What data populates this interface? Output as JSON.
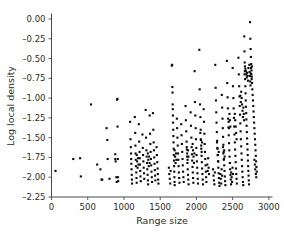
{
  "figure": {
    "background_color": "#ffffff",
    "marker_color": "#0a0a0a",
    "axis_color": "#4a4a4a"
  },
  "chart_data": {
    "type": "scatter",
    "title": "",
    "xlabel": "Range size",
    "ylabel": "Log local density",
    "xlim": [
      0,
      3050
    ],
    "ylim": [
      -2.25,
      0.05
    ],
    "xticks": [
      0,
      500,
      1000,
      1500,
      2000,
      2500,
      3000
    ],
    "xticklabels": [
      "0",
      "500",
      "1000",
      "1500",
      "2000",
      "2500",
      "3000"
    ],
    "yticks": [
      0.0,
      -0.25,
      -0.5,
      -0.75,
      -1.0,
      -1.25,
      -1.5,
      -1.75,
      -2.0,
      -2.25
    ],
    "yticklabels": [
      "0.00",
      "–0.25",
      "–0.50",
      "–0.75",
      "–1.00",
      "–1.25",
      "–1.50",
      "–1.75",
      "–2.00",
      "–2.25"
    ],
    "grid": false,
    "legend": null,
    "marker": "square",
    "marker_size": 2.1,
    "points": [
      [
        55,
        -1.92
      ],
      [
        300,
        -1.77
      ],
      [
        395,
        -1.76
      ],
      [
        405,
        -1.99
      ],
      [
        545,
        -1.08
      ],
      [
        630,
        -1.84
      ],
      [
        675,
        -1.9
      ],
      [
        690,
        -2.03
      ],
      [
        700,
        -2.03
      ],
      [
        760,
        -1.38
      ],
      [
        770,
        -1.53
      ],
      [
        775,
        -1.77
      ],
      [
        800,
        -2.02
      ],
      [
        880,
        -1.77
      ],
      [
        880,
        -1.71
      ],
      [
        885,
        -1.8
      ],
      [
        895,
        -2.0
      ],
      [
        900,
        -2.06
      ],
      [
        905,
        -1.02
      ],
      [
        910,
        -1.01
      ],
      [
        912,
        -1.36
      ],
      [
        915,
        -1.77
      ],
      [
        918,
        -2.0
      ],
      [
        920,
        -2.05
      ],
      [
        1085,
        -1.3
      ],
      [
        1090,
        -1.52
      ],
      [
        1095,
        -1.62
      ],
      [
        1098,
        -1.7
      ],
      [
        1100,
        -1.77
      ],
      [
        1102,
        -1.83
      ],
      [
        1105,
        -1.9
      ],
      [
        1108,
        -1.97
      ],
      [
        1110,
        -2.03
      ],
      [
        1112,
        -2.08
      ],
      [
        1150,
        -1.24
      ],
      [
        1155,
        -1.44
      ],
      [
        1158,
        -1.6
      ],
      [
        1160,
        -1.7
      ],
      [
        1163,
        -1.78
      ],
      [
        1166,
        -1.86
      ],
      [
        1170,
        -1.94
      ],
      [
        1173,
        -2.01
      ],
      [
        1176,
        -2.07
      ],
      [
        1205,
        -1.33
      ],
      [
        1210,
        -1.55
      ],
      [
        1215,
        -1.68
      ],
      [
        1218,
        -1.76
      ],
      [
        1222,
        -1.84
      ],
      [
        1225,
        -1.92
      ],
      [
        1228,
        -1.99
      ],
      [
        1232,
        -2.05
      ],
      [
        1255,
        -1.46
      ],
      [
        1260,
        -1.63
      ],
      [
        1264,
        -1.72
      ],
      [
        1268,
        -1.8
      ],
      [
        1272,
        -1.88
      ],
      [
        1276,
        -1.95
      ],
      [
        1280,
        -2.02
      ],
      [
        1300,
        -1.15
      ],
      [
        1305,
        -1.5
      ],
      [
        1310,
        -1.66
      ],
      [
        1314,
        -1.74
      ],
      [
        1318,
        -1.82
      ],
      [
        1322,
        -1.9
      ],
      [
        1326,
        -1.97
      ],
      [
        1330,
        -2.04
      ],
      [
        1334,
        -2.09
      ],
      [
        1355,
        -1.22
      ],
      [
        1360,
        -1.45
      ],
      [
        1364,
        -1.58
      ],
      [
        1368,
        -1.68
      ],
      [
        1372,
        -1.77
      ],
      [
        1376,
        -1.85
      ],
      [
        1380,
        -1.93
      ],
      [
        1384,
        -2.0
      ],
      [
        1388,
        -2.06
      ],
      [
        1400,
        -1.19
      ],
      [
        1405,
        -1.4
      ],
      [
        1410,
        -1.56
      ],
      [
        1414,
        -1.66
      ],
      [
        1418,
        -1.75
      ],
      [
        1422,
        -1.83
      ],
      [
        1426,
        -1.91
      ],
      [
        1430,
        -1.98
      ],
      [
        1434,
        -2.04
      ],
      [
        1450,
        -1.62
      ],
      [
        1455,
        -1.72
      ],
      [
        1460,
        -1.81
      ],
      [
        1464,
        -1.89
      ],
      [
        1468,
        -1.96
      ],
      [
        1472,
        -2.03
      ],
      [
        1476,
        -2.08
      ],
      [
        1660,
        -0.59
      ],
      [
        1665,
        -0.58
      ],
      [
        1668,
        -0.86
      ],
      [
        1670,
        -0.93
      ],
      [
        1672,
        -1.08
      ],
      [
        1674,
        -1.14
      ],
      [
        1676,
        -1.22
      ],
      [
        1678,
        -1.31
      ],
      [
        1680,
        -1.4
      ],
      [
        1682,
        -1.48
      ],
      [
        1684,
        -1.56
      ],
      [
        1686,
        -1.64
      ],
      [
        1688,
        -1.72
      ],
      [
        1690,
        -1.79
      ],
      [
        1692,
        -1.86
      ],
      [
        1694,
        -1.93
      ],
      [
        1696,
        -2.0
      ],
      [
        1698,
        -2.06
      ],
      [
        1700,
        -2.1
      ],
      [
        1730,
        -1.26
      ],
      [
        1734,
        -1.38
      ],
      [
        1738,
        -1.5
      ],
      [
        1742,
        -1.6
      ],
      [
        1746,
        -1.7
      ],
      [
        1750,
        -1.78
      ],
      [
        1754,
        -1.86
      ],
      [
        1758,
        -1.94
      ],
      [
        1762,
        -2.01
      ],
      [
        1766,
        -2.07
      ],
      [
        1790,
        -1.33
      ],
      [
        1795,
        -1.47
      ],
      [
        1800,
        -1.58
      ],
      [
        1804,
        -1.68
      ],
      [
        1808,
        -1.77
      ],
      [
        1812,
        -1.85
      ],
      [
        1816,
        -1.93
      ],
      [
        1820,
        -2.0
      ],
      [
        1824,
        -2.06
      ],
      [
        1850,
        -1.1
      ],
      [
        1855,
        -1.28
      ],
      [
        1860,
        -1.42
      ],
      [
        1864,
        -1.55
      ],
      [
        1868,
        -1.65
      ],
      [
        1872,
        -1.74
      ],
      [
        1876,
        -1.82
      ],
      [
        1880,
        -1.9
      ],
      [
        1884,
        -1.97
      ],
      [
        1888,
        -2.03
      ],
      [
        1892,
        -2.09
      ],
      [
        1920,
        -1.18
      ],
      [
        1925,
        -1.35
      ],
      [
        1930,
        -1.5
      ],
      [
        1934,
        -1.62
      ],
      [
        1938,
        -1.71
      ],
      [
        1942,
        -1.79
      ],
      [
        1946,
        -1.87
      ],
      [
        1950,
        -1.94
      ],
      [
        1954,
        -2.01
      ],
      [
        1958,
        -2.07
      ],
      [
        1975,
        -0.66
      ],
      [
        1980,
        -1.05
      ],
      [
        1985,
        -1.22
      ],
      [
        1990,
        -1.38
      ],
      [
        1994,
        -1.52
      ],
      [
        1998,
        -1.63
      ],
      [
        2002,
        -1.72
      ],
      [
        2006,
        -1.8
      ],
      [
        2010,
        -1.88
      ],
      [
        2014,
        -1.95
      ],
      [
        2018,
        -2.02
      ],
      [
        2022,
        -2.08
      ],
      [
        2040,
        -0.39
      ],
      [
        2045,
        -0.89
      ],
      [
        2050,
        -1.08
      ],
      [
        2055,
        -1.24
      ],
      [
        2059,
        -1.4
      ],
      [
        2063,
        -1.53
      ],
      [
        2067,
        -1.64
      ],
      [
        2071,
        -1.73
      ],
      [
        2075,
        -1.81
      ],
      [
        2079,
        -1.89
      ],
      [
        2083,
        -1.96
      ],
      [
        2087,
        -2.03
      ],
      [
        2091,
        -2.09
      ],
      [
        2100,
        -1.14
      ],
      [
        2105,
        -1.3
      ],
      [
        2110,
        -1.45
      ],
      [
        2114,
        -1.58
      ],
      [
        2118,
        -1.68
      ],
      [
        2122,
        -1.77
      ],
      [
        2126,
        -1.85
      ],
      [
        2130,
        -1.93
      ],
      [
        2134,
        -2.0
      ],
      [
        2138,
        -2.06
      ],
      [
        2260,
        -0.58
      ],
      [
        2265,
        -0.87
      ],
      [
        2270,
        -1.03
      ],
      [
        2274,
        -1.18
      ],
      [
        2278,
        -1.31
      ],
      [
        2282,
        -1.43
      ],
      [
        2286,
        -1.54
      ],
      [
        2290,
        -1.63
      ],
      [
        2294,
        -1.72
      ],
      [
        2298,
        -1.8
      ],
      [
        2302,
        -1.88
      ],
      [
        2306,
        -1.95
      ],
      [
        2310,
        -2.01
      ],
      [
        2314,
        -2.07
      ],
      [
        2318,
        -2.11
      ],
      [
        2350,
        -0.96
      ],
      [
        2355,
        -1.12
      ],
      [
        2360,
        -1.26
      ],
      [
        2364,
        -1.38
      ],
      [
        2368,
        -1.49
      ],
      [
        2372,
        -1.59
      ],
      [
        2376,
        -1.68
      ],
      [
        2380,
        -1.77
      ],
      [
        2384,
        -1.85
      ],
      [
        2388,
        -1.92
      ],
      [
        2392,
        -1.99
      ],
      [
        2396,
        -2.05
      ],
      [
        2400,
        -2.1
      ],
      [
        2420,
        -0.53
      ],
      [
        2425,
        -0.81
      ],
      [
        2430,
        -0.99
      ],
      [
        2434,
        -1.13
      ],
      [
        2438,
        -1.26
      ],
      [
        2442,
        -1.37
      ],
      [
        2446,
        -1.47
      ],
      [
        2450,
        -1.57
      ],
      [
        2454,
        -1.66
      ],
      [
        2458,
        -1.74
      ],
      [
        2462,
        -1.82
      ],
      [
        2466,
        -1.9
      ],
      [
        2470,
        -1.97
      ],
      [
        2474,
        -2.03
      ],
      [
        2478,
        -2.09
      ],
      [
        2500,
        -0.62
      ],
      [
        2505,
        -0.85
      ],
      [
        2510,
        -1.0
      ],
      [
        2514,
        -1.13
      ],
      [
        2518,
        -1.25
      ],
      [
        2522,
        -1.36
      ],
      [
        2526,
        -1.46
      ],
      [
        2530,
        -1.56
      ],
      [
        2534,
        -1.65
      ],
      [
        2538,
        -1.73
      ],
      [
        2542,
        -1.81
      ],
      [
        2546,
        -1.89
      ],
      [
        2550,
        -1.96
      ],
      [
        2554,
        -2.02
      ],
      [
        2558,
        -2.08
      ],
      [
        2580,
        -0.49
      ],
      [
        2585,
        -0.7
      ],
      [
        2590,
        -0.85
      ],
      [
        2594,
        -0.98
      ],
      [
        2598,
        -1.1
      ],
      [
        2602,
        -1.21
      ],
      [
        2606,
        -1.32
      ],
      [
        2610,
        -1.42
      ],
      [
        2614,
        -1.52
      ],
      [
        2618,
        -1.61
      ],
      [
        2622,
        -1.7
      ],
      [
        2626,
        -1.78
      ],
      [
        2630,
        -1.86
      ],
      [
        2634,
        -1.93
      ],
      [
        2638,
        -2.0
      ],
      [
        2642,
        -2.06
      ],
      [
        2646,
        -2.1
      ],
      [
        2660,
        -0.22
      ],
      [
        2663,
        -0.41
      ],
      [
        2666,
        -0.55
      ],
      [
        2669,
        -0.66
      ],
      [
        2672,
        -0.76
      ],
      [
        2675,
        -0.85
      ],
      [
        2678,
        -0.94
      ],
      [
        2681,
        -1.03
      ],
      [
        2684,
        -1.11
      ],
      [
        2687,
        -1.19
      ],
      [
        2690,
        -1.27
      ],
      [
        2693,
        -1.35
      ],
      [
        2696,
        -1.43
      ],
      [
        2699,
        -1.51
      ],
      [
        2702,
        -1.58
      ],
      [
        2705,
        -1.65
      ],
      [
        2708,
        -1.72
      ],
      [
        2711,
        -1.79
      ],
      [
        2714,
        -1.86
      ],
      [
        2717,
        -1.92
      ],
      [
        2720,
        -1.98
      ],
      [
        2723,
        -2.04
      ],
      [
        2726,
        -2.09
      ],
      [
        2740,
        -0.04
      ],
      [
        2744,
        -0.25
      ],
      [
        2748,
        -0.38
      ],
      [
        2752,
        -0.48
      ],
      [
        2756,
        -0.57
      ],
      [
        2760,
        -0.65
      ],
      [
        2764,
        -0.73
      ],
      [
        2768,
        -0.81
      ],
      [
        2772,
        -0.89
      ],
      [
        2776,
        -0.96
      ],
      [
        2780,
        -1.03
      ],
      [
        2784,
        -1.1
      ],
      [
        2788,
        -1.17
      ],
      [
        2792,
        -1.24
      ],
      [
        2796,
        -1.31
      ],
      [
        2800,
        -1.38
      ],
      [
        2804,
        -1.45
      ],
      [
        2808,
        -1.52
      ],
      [
        2812,
        -1.59
      ],
      [
        2816,
        -1.66
      ],
      [
        2820,
        -1.73
      ],
      [
        2824,
        -1.8
      ],
      [
        2828,
        -1.87
      ],
      [
        2832,
        -1.93
      ],
      [
        2700,
        -0.68
      ],
      [
        2706,
        -0.72
      ],
      [
        2712,
        -0.78
      ],
      [
        2718,
        -0.62
      ],
      [
        2688,
        -0.7
      ],
      [
        2694,
        -0.74
      ],
      [
        2682,
        -0.66
      ],
      [
        2676,
        -0.63
      ],
      [
        2670,
        -0.6
      ],
      [
        2664,
        -0.7
      ],
      [
        2730,
        -0.58
      ],
      [
        2734,
        -0.67
      ],
      [
        2738,
        -0.72
      ],
      [
        2742,
        -0.79
      ],
      [
        2746,
        -0.84
      ],
      [
        2750,
        -0.69
      ],
      [
        2754,
        -0.62
      ],
      [
        2758,
        -0.7
      ],
      [
        2762,
        -0.76
      ],
      [
        2766,
        -0.6
      ],
      [
        2606,
        -0.97
      ],
      [
        2612,
        -1.05
      ],
      [
        2618,
        -0.92
      ],
      [
        2624,
        -1.0
      ],
      [
        2630,
        -1.08
      ],
      [
        2636,
        -1.16
      ],
      [
        2642,
        -1.24
      ],
      [
        2648,
        -1.12
      ],
      [
        2654,
        -1.2
      ],
      [
        2658,
        -1.28
      ],
      [
        2530,
        -1.2
      ],
      [
        2536,
        -1.28
      ],
      [
        2542,
        -1.36
      ],
      [
        2548,
        -1.44
      ],
      [
        2554,
        -1.52
      ],
      [
        2444,
        -1.3
      ],
      [
        2450,
        -1.38
      ],
      [
        2456,
        -1.2
      ],
      [
        2462,
        -1.28
      ],
      [
        2468,
        -1.36
      ],
      [
        2366,
        -1.62
      ],
      [
        2372,
        -1.7
      ],
      [
        2378,
        -1.78
      ],
      [
        2384,
        -1.66
      ],
      [
        2390,
        -1.74
      ],
      [
        2284,
        -1.56
      ],
      [
        2290,
        -1.64
      ],
      [
        2296,
        -1.72
      ],
      [
        2302,
        -1.8
      ],
      [
        2308,
        -1.68
      ],
      [
        2054,
        -1.44
      ],
      [
        2060,
        -1.52
      ],
      [
        2066,
        -1.6
      ],
      [
        2072,
        -1.68
      ],
      [
        2078,
        -1.56
      ],
      [
        1948,
        -1.58
      ],
      [
        1954,
        -1.66
      ],
      [
        1960,
        -1.74
      ],
      [
        1966,
        -1.82
      ],
      [
        1972,
        -1.7
      ],
      [
        1866,
        -1.62
      ],
      [
        1872,
        -1.7
      ],
      [
        1878,
        -1.78
      ],
      [
        1884,
        -1.66
      ],
      [
        1890,
        -1.74
      ],
      [
        1700,
        -1.66
      ],
      [
        1706,
        -1.74
      ],
      [
        1712,
        -1.82
      ],
      [
        1718,
        -1.7
      ],
      [
        1724,
        -1.78
      ],
      [
        1330,
        -1.7
      ],
      [
        1336,
        -1.78
      ],
      [
        1342,
        -1.86
      ],
      [
        1348,
        -1.74
      ],
      [
        1354,
        -1.82
      ],
      [
        1176,
        -1.72
      ],
      [
        1182,
        -1.8
      ],
      [
        1188,
        -1.88
      ],
      [
        1194,
        -1.76
      ],
      [
        1200,
        -1.84
      ],
      [
        2820,
        -1.96
      ],
      [
        2826,
        -2.0
      ],
      [
        2812,
        -1.9
      ],
      [
        2806,
        -1.84
      ],
      [
        2800,
        -1.78
      ],
      [
        2150,
        -1.84
      ],
      [
        2156,
        -1.92
      ],
      [
        2162,
        -1.76
      ],
      [
        2168,
        -1.88
      ],
      [
        2174,
        -1.96
      ],
      [
        2480,
        -1.94
      ],
      [
        2486,
        -2.0
      ],
      [
        2492,
        -2.06
      ],
      [
        2498,
        -1.88
      ],
      [
        2504,
        -1.96
      ],
      [
        2330,
        -1.96
      ],
      [
        2336,
        -2.02
      ],
      [
        2342,
        -2.08
      ],
      [
        2348,
        -1.9
      ],
      [
        2354,
        -1.98
      ],
      [
        1620,
        -1.88
      ],
      [
        1626,
        -1.96
      ],
      [
        1632,
        -2.02
      ],
      [
        1638,
        -2.08
      ],
      [
        1644,
        -1.92
      ],
      [
        2230,
        -1.9
      ],
      [
        2236,
        -1.98
      ],
      [
        2242,
        -2.04
      ],
      [
        2248,
        -2.09
      ],
      [
        2254,
        -1.94
      ]
    ]
  }
}
